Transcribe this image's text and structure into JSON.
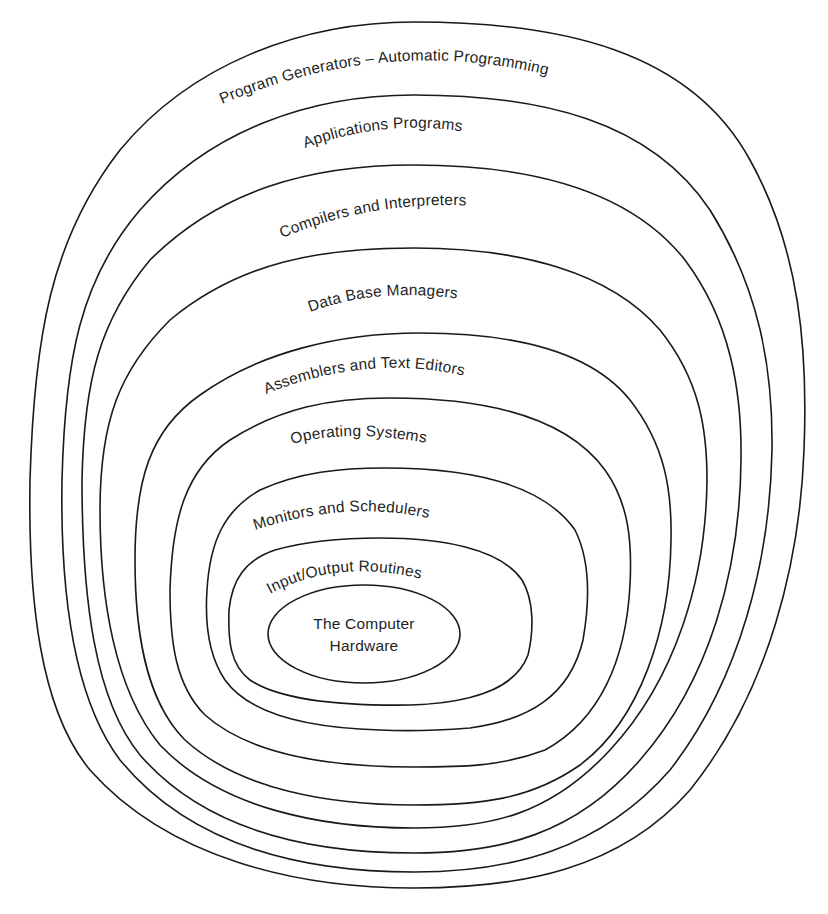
{
  "figure": {
    "type": "nested-layer-diagram",
    "stroke_color": "#1a1a1a",
    "text_color": "#1f1f1f",
    "background": "#ffffff",
    "layers": [
      {
        "id": "layer-1",
        "label": "Program Generators – Automatic Programming"
      },
      {
        "id": "layer-2",
        "label": "Applications Programs"
      },
      {
        "id": "layer-3",
        "label": "Compilers and Interpreters"
      },
      {
        "id": "layer-4",
        "label": "Data Base Managers"
      },
      {
        "id": "layer-5",
        "label": "Assemblers and Text Editors"
      },
      {
        "id": "layer-6",
        "label": "Operating Systems"
      },
      {
        "id": "layer-7",
        "label": "Monitors and Schedulers"
      },
      {
        "id": "layer-8",
        "label": "Input/Output Routines"
      },
      {
        "id": "layer-9",
        "label_line1": "The Computer",
        "label_line2": "Hardware"
      }
    ]
  }
}
